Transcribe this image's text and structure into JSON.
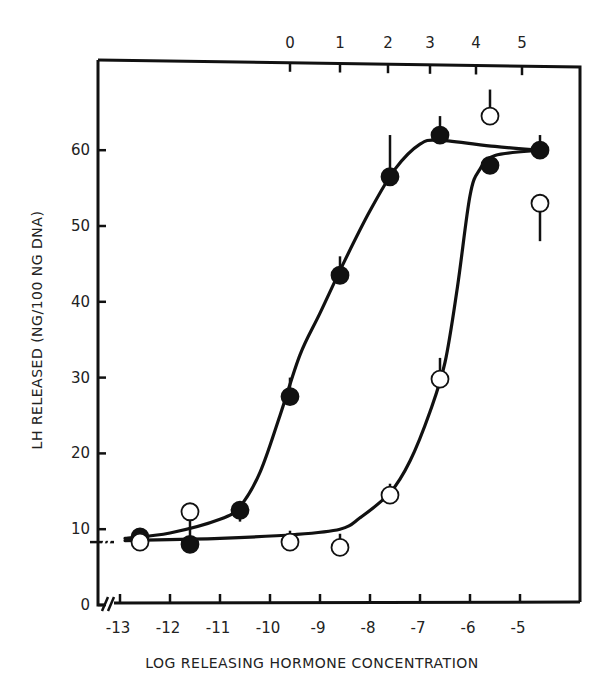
{
  "chart_data": {
    "type": "scatter",
    "title": "",
    "xlabel": "LOG RELEASING HORMONE CONCENTRATION",
    "ylabel": "LH RELEASED (NG/100 NG DNA)",
    "x_ticks": [
      -13,
      -12,
      -11,
      -10,
      -9,
      -8,
      -7,
      -6,
      -5
    ],
    "x_tick_labels": [
      "-13",
      "-12",
      "-11",
      "-10",
      "-9",
      "-8",
      "-7",
      "-6",
      "-5"
    ],
    "top_ticks": [
      0,
      1,
      2,
      3,
      4,
      5
    ],
    "top_tick_labels": [
      "0",
      "1",
      "2",
      "3",
      "4",
      "5"
    ],
    "y_ticks": [
      0,
      10,
      20,
      30,
      40,
      50,
      60
    ],
    "y_tick_labels": [
      "0",
      "10",
      "20",
      "30",
      "40",
      "50",
      "60"
    ],
    "xlim": [
      -13.3,
      -4.35
    ],
    "ylim": [
      0,
      60
    ],
    "grid": false,
    "legend": "none",
    "axis_breaks": [
      "x-axis near -13",
      "y-axis near 8"
    ],
    "series": [
      {
        "name": "filled circles",
        "marker": "filled-circle",
        "x": [
          -12.6,
          -11.6,
          -10.6,
          -9.6,
          -8.6,
          -7.6,
          -6.6,
          -5.6,
          -4.6
        ],
        "y": [
          9.0,
          8.0,
          12.5,
          27.5,
          43.5,
          56.5,
          62.0,
          58.0,
          60.0
        ],
        "error_up": [
          0,
          0,
          0,
          2.5,
          2.5,
          5.5,
          2.5,
          0,
          2.0
        ],
        "error_down": [
          0,
          0,
          1.5,
          0,
          0,
          0,
          0,
          0,
          0
        ]
      },
      {
        "name": "open circles",
        "marker": "open-circle",
        "x": [
          -12.6,
          -11.6,
          -9.6,
          -8.6,
          -7.6,
          -6.6,
          -5.6,
          -4.6
        ],
        "y": [
          8.3,
          12.3,
          8.3,
          7.6,
          14.5,
          29.8,
          64.5,
          53.0
        ],
        "error_up": [
          0,
          0,
          1.5,
          1.8,
          1.5,
          2.8,
          3.5,
          0
        ],
        "error_down": [
          0,
          3.3,
          0,
          0,
          0,
          0,
          0,
          5.0
        ]
      }
    ],
    "fit_curves": [
      {
        "name": "filled curve",
        "points": [
          [
            -12.9,
            8.8
          ],
          [
            -12.0,
            9.5
          ],
          [
            -11.0,
            11.3
          ],
          [
            -10.6,
            13.0
          ],
          [
            -10.2,
            17.5
          ],
          [
            -9.8,
            25.0
          ],
          [
            -9.4,
            33.0
          ],
          [
            -9.0,
            38.5
          ],
          [
            -8.5,
            45.5
          ],
          [
            -8.0,
            52.0
          ],
          [
            -7.5,
            57.5
          ],
          [
            -7.0,
            60.8
          ],
          [
            -6.6,
            61.3
          ],
          [
            -5.5,
            60.5
          ],
          [
            -4.6,
            60.0
          ]
        ]
      },
      {
        "name": "open curve",
        "points": [
          [
            -12.9,
            8.5
          ],
          [
            -11.0,
            8.8
          ],
          [
            -9.5,
            9.3
          ],
          [
            -8.6,
            10.0
          ],
          [
            -8.2,
            11.5
          ],
          [
            -7.6,
            14.8
          ],
          [
            -7.2,
            19.0
          ],
          [
            -6.8,
            25.5
          ],
          [
            -6.5,
            32.0
          ],
          [
            -6.25,
            42.0
          ],
          [
            -6.0,
            54.0
          ],
          [
            -5.8,
            57.5
          ],
          [
            -5.5,
            59.3
          ],
          [
            -4.6,
            60.0
          ]
        ]
      }
    ]
  }
}
